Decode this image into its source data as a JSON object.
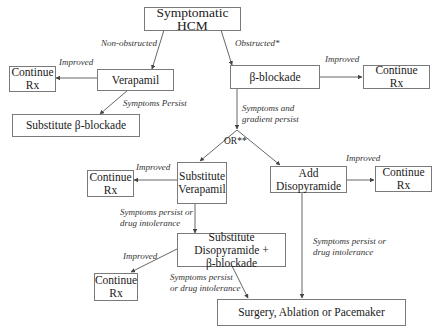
{
  "diagram": {
    "type": "flowchart",
    "nodes": {
      "start": "Symptomatic HCM",
      "verapamil": "Verapamil",
      "continue_rx_1": [
        "Continue",
        "Rx"
      ],
      "substitute_beta": "Substitute β-blockade",
      "beta_blockade": "β-blockade",
      "continue_rx_2": [
        "Continue",
        "Rx"
      ],
      "substitute_verapamil": [
        "Substitute",
        "Verapamil"
      ],
      "continue_rx_3": [
        "Continue",
        "Rx"
      ],
      "add_disopyramide": [
        "Add",
        "Disopyramide"
      ],
      "continue_rx_4": [
        "Continue",
        "Rx"
      ],
      "substitute_disopyramide": [
        "Substitute Disopyramide +",
        "β-blockade"
      ],
      "continue_rx_5": [
        "Continue",
        "Rx"
      ],
      "surgery": "Surgery, Ablation or Pacemaker"
    },
    "edge_labels": {
      "non_obstructed": "Non-obstructed",
      "obstructed": "Obstructed*",
      "improved_1": "Improved",
      "symptoms_persist": "Symptoms Persist",
      "improved_2": "Improved",
      "symptoms_gradient": [
        "Symptoms and",
        "gradient persist"
      ],
      "or": "OR**",
      "improved_3": "Improved",
      "improved_4": "Improved",
      "persist_intolerance_1": [
        "Symptoms persist or",
        "drug intolerance"
      ],
      "persist_intolerance_2": [
        "Symptoms persist or",
        "drug intolerance"
      ],
      "improved_5": "Improved",
      "persist_intolerance_3": [
        "Symptoms persist",
        "or drug intolerance"
      ]
    },
    "colors": {
      "border": "#7a7a7a",
      "line": "#555555",
      "text": "#1a1a1a"
    }
  }
}
